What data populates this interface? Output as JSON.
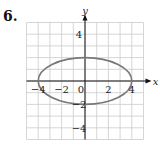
{
  "problem": {
    "number": "6."
  },
  "chart_data": {
    "type": "line",
    "title": "",
    "xlabel": "x",
    "ylabel": "y",
    "xlim": [
      -5,
      5
    ],
    "ylim": [
      -5,
      5
    ],
    "grid": true,
    "x_tick_labels": [
      "-4",
      "-2",
      "0",
      "2",
      "4"
    ],
    "y_tick_labels": [
      "4",
      "-2",
      "-4"
    ],
    "series": [
      {
        "name": "ellipse",
        "shape": "ellipse",
        "center": [
          0,
          0
        ],
        "semi_major_x": 4,
        "semi_minor_y": 2,
        "equation": "x^2/16 + y^2/4 = 1"
      }
    ],
    "curve_color": "#777777"
  }
}
